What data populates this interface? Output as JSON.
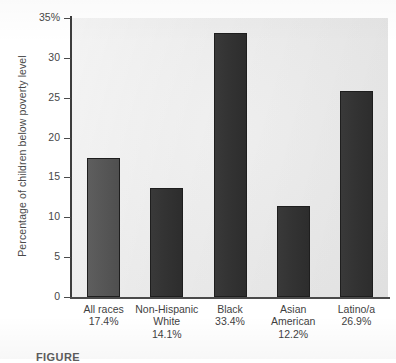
{
  "chart_data": {
    "type": "bar",
    "title": "",
    "xlabel": "",
    "ylabel": "Percentage of children below poverty level",
    "ylim": [
      0,
      35
    ],
    "grid": false,
    "legend": "none",
    "y_ticks": [
      {
        "label": "0",
        "value": 0
      },
      {
        "label": "5",
        "value": 5
      },
      {
        "label": "10",
        "value": 10
      },
      {
        "label": "15",
        "value": 15
      },
      {
        "label": "20",
        "value": 20
      },
      {
        "label": "25",
        "value": 25
      },
      {
        "label": "30",
        "value": 30
      },
      {
        "label": "35%",
        "value": 35
      }
    ],
    "categories": [
      "All races",
      "Non-Hispanic White",
      "Black",
      "Asian American",
      "Latino/a"
    ],
    "values": [
      17.4,
      14.1,
      33.4,
      12.2,
      26.9
    ],
    "bar_heights_plotted": [
      17.4,
      13.7,
      33.1,
      11.4,
      25.8
    ],
    "value_labels": [
      "17.4%",
      "14.1%",
      "33.4%",
      "12.2%",
      "26.9%"
    ],
    "bar_colors": [
      "#575757",
      "#333333",
      "#333333",
      "#333333",
      "#333333"
    ],
    "bars": [
      {
        "name_line1": "All races",
        "name_line2": "",
        "value_label": "17.4%",
        "value": 17.4,
        "plotted": 17.4,
        "color": "#575757"
      },
      {
        "name_line1": "Non-Hispanic",
        "name_line2": "White",
        "value_label": "14.1%",
        "value": 14.1,
        "plotted": 13.7,
        "color": "#333333"
      },
      {
        "name_line1": "Black",
        "name_line2": "",
        "value_label": "33.4%",
        "value": 33.4,
        "plotted": 33.1,
        "color": "#333333"
      },
      {
        "name_line1": "Asian",
        "name_line2": "American",
        "value_label": "12.2%",
        "value": 12.2,
        "plotted": 11.4,
        "color": "#333333"
      },
      {
        "name_line1": "Latino/a",
        "name_line2": "",
        "value_label": "26.9%",
        "value": 26.9,
        "plotted": 25.8,
        "color": "#333333"
      }
    ]
  },
  "caption": {
    "text": "FIGURE"
  },
  "colors": {
    "plot_background": "#eaeaea",
    "page_background": "#ffffff",
    "axis": "#3d3d3d",
    "bar_light": "#575757",
    "bar_dark": "#333333",
    "text": "#3f3f3f"
  }
}
